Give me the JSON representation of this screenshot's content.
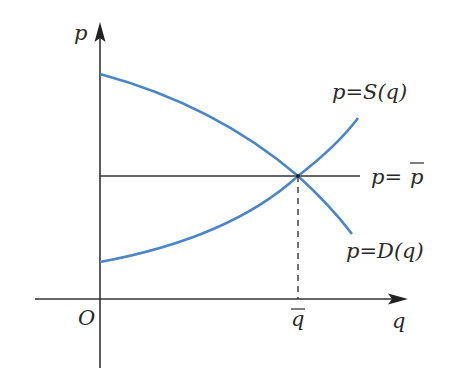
{
  "diagram": {
    "colors": {
      "axis": "#333333",
      "curve": "#4a86c8",
      "background": "#ffffff"
    },
    "axes": {
      "y_label": "p",
      "x_label": "q",
      "origin_label": "O"
    },
    "curves": {
      "supply_label": "p=S(q)",
      "demand_label": "p=D(q)",
      "price_line_label_prefix": "p=",
      "price_line_label_bar": "p"
    },
    "equilibrium": {
      "q_bar_label": "q"
    }
  }
}
